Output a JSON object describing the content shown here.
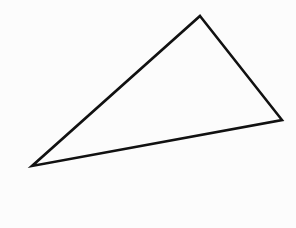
{
  "figure": {
    "shape": "triangle",
    "stroke_color": "#111111",
    "background_color": "#fcfcfc",
    "vertices": {
      "top": [
        200,
        16
      ],
      "right": [
        282,
        120
      ],
      "left": [
        32,
        166
      ]
    }
  }
}
